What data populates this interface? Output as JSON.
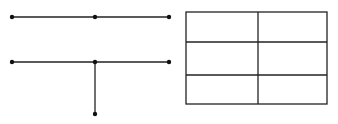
{
  "diagram": {
    "stroke_color": "#222222",
    "background": "#ffffff",
    "tree": {
      "lines": [
        {
          "name": "top-branch",
          "x1": 12,
          "y1": 17,
          "x2": 169,
          "y2": 17
        },
        {
          "name": "middle-branch",
          "x1": 12,
          "y1": 62,
          "x2": 169,
          "y2": 62
        },
        {
          "name": "vertical-stem",
          "x1": 95,
          "y1": 62,
          "x2": 95,
          "y2": 114
        }
      ],
      "nodes": [
        {
          "x": 12,
          "y": 17
        },
        {
          "x": 95,
          "y": 17
        },
        {
          "x": 169,
          "y": 17
        },
        {
          "x": 12,
          "y": 62
        },
        {
          "x": 95,
          "y": 62
        },
        {
          "x": 169,
          "y": 62
        },
        {
          "x": 95,
          "y": 114
        }
      ]
    },
    "grid": {
      "x": 186,
      "y": 12,
      "width": 141,
      "height": 92,
      "rows": 3,
      "cols": 2,
      "col_dividers": [
        258
      ],
      "row_dividers": [
        42,
        75
      ],
      "cells": [
        [
          "",
          ""
        ],
        [
          "",
          ""
        ],
        [
          "",
          ""
        ]
      ]
    }
  }
}
